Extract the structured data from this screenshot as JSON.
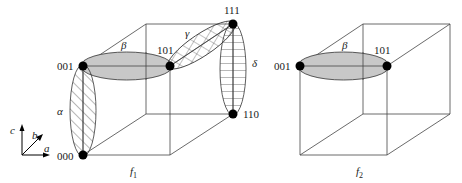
{
  "figure": {
    "cube1": {
      "caption": "f",
      "caption_sub": "1",
      "vertices": {
        "v000": "000",
        "v001": "001",
        "v101": "101",
        "v111": "111",
        "v110": "110"
      },
      "groups": {
        "alpha": "α",
        "beta": "β",
        "gamma": "γ",
        "delta": "δ"
      }
    },
    "cube2": {
      "caption": "f",
      "caption_sub": "2",
      "vertices": {
        "v001": "001",
        "v101": "101"
      },
      "groups": {
        "beta": "β"
      }
    },
    "axes": {
      "a": "a",
      "b": "b",
      "c": "c"
    },
    "colors": {
      "ellipse_fill": "#c8c8c8",
      "line": "#444444",
      "dot": "#000000"
    }
  }
}
